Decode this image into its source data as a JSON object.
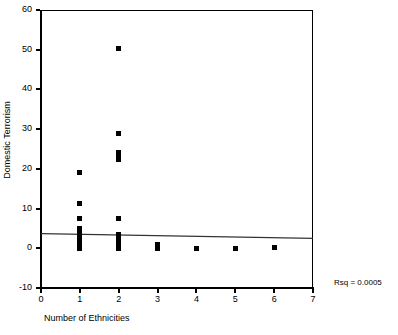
{
  "chart_data": {
    "type": "scatter",
    "title": "",
    "xlabel": "Number of Ethnicities",
    "ylabel": "Domestic Terrorism",
    "xlim": [
      0,
      7
    ],
    "ylim": [
      -10,
      60
    ],
    "xticks": [
      0,
      1,
      2,
      3,
      4,
      5,
      6,
      7
    ],
    "xticklabels": [
      "0",
      "1",
      "2",
      "3",
      "4",
      "5",
      "6",
      "7"
    ],
    "yticks": [
      -10,
      0,
      10,
      20,
      30,
      40,
      50,
      60
    ],
    "yticklabels": [
      "-10",
      "0",
      "10",
      "20",
      "30",
      "40",
      "50",
      "60"
    ],
    "grid": false,
    "legend": null,
    "marker": "square",
    "marker_color": "#000000",
    "annotations": [
      {
        "text": "Rsq = 0.0005",
        "position": "outside-bottom-right"
      }
    ],
    "fit_line": {
      "type": "linear",
      "x": [
        0,
        7
      ],
      "y": [
        3.7,
        2.5
      ],
      "color": "#333333",
      "rsq": 0.0005
    },
    "points": [
      {
        "x": 1,
        "y": 19.0
      },
      {
        "x": 1,
        "y": 11.2
      },
      {
        "x": 1,
        "y": 7.6
      },
      {
        "x": 1,
        "y": 5.0
      },
      {
        "x": 1,
        "y": 4.3
      },
      {
        "x": 1,
        "y": 3.6
      },
      {
        "x": 1,
        "y": 3.0
      },
      {
        "x": 1,
        "y": 2.4
      },
      {
        "x": 1,
        "y": 1.8
      },
      {
        "x": 1,
        "y": 1.2
      },
      {
        "x": 1,
        "y": 0.6
      },
      {
        "x": 1,
        "y": 0.0
      },
      {
        "x": 2,
        "y": 50.4
      },
      {
        "x": 2,
        "y": 28.8
      },
      {
        "x": 2,
        "y": 24.2
      },
      {
        "x": 2,
        "y": 23.4
      },
      {
        "x": 2,
        "y": 22.4
      },
      {
        "x": 2,
        "y": 7.6
      },
      {
        "x": 2,
        "y": 3.4
      },
      {
        "x": 2,
        "y": 2.8
      },
      {
        "x": 2,
        "y": 2.0
      },
      {
        "x": 2,
        "y": 1.4
      },
      {
        "x": 2,
        "y": 0.8
      },
      {
        "x": 2,
        "y": 0.0
      },
      {
        "x": 3,
        "y": 1.0
      },
      {
        "x": 3,
        "y": 0.0
      },
      {
        "x": 4,
        "y": 0.0
      },
      {
        "x": 5,
        "y": 0.0
      },
      {
        "x": 6,
        "y": 0.2
      }
    ]
  }
}
